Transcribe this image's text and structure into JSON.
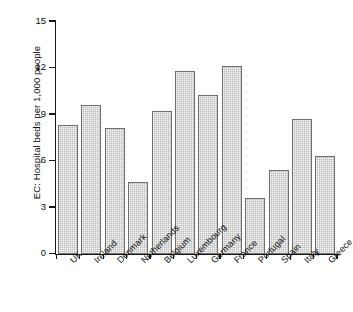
{
  "chart_data": {
    "type": "bar",
    "title": "",
    "xlabel": "",
    "ylabel": "EC: Hospital beds per 1,000 people",
    "ylim": [
      0,
      15
    ],
    "yticks": [
      0,
      3,
      6,
      9,
      12,
      15
    ],
    "grid": false,
    "legend": null,
    "categories": [
      "UK",
      "Ireland",
      "Denmark",
      "Netherlands",
      "Belgium",
      "Luxembourg",
      "Germany",
      "France",
      "Portugal",
      "Spain",
      "Italy",
      "Greece"
    ],
    "values": [
      8.3,
      9.6,
      8.1,
      4.6,
      9.2,
      11.8,
      10.2,
      12.1,
      3.6,
      5.4,
      8.7,
      6.3
    ],
    "series": [
      {
        "name": "Hospital beds per 1,000 people",
        "values": [
          8.3,
          9.6,
          8.1,
          4.6,
          9.2,
          11.8,
          10.2,
          12.1,
          3.6,
          5.4,
          8.7,
          6.3
        ]
      }
    ],
    "bar_fill_color": "#b9b9b9",
    "bar_edge_color": "#6f6f6f",
    "axis_color": "#1a1a1a",
    "background_color": "#ffffff"
  }
}
